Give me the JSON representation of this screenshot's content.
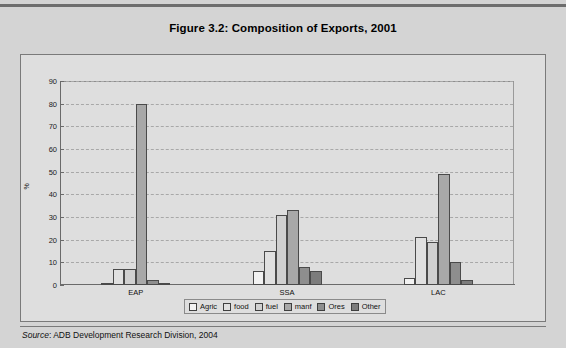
{
  "figure": {
    "title": "Figure 3.2:  Composition of Exports, 2001",
    "source_prefix": "Source",
    "source_text": ": ADB Development Research Division, 2004"
  },
  "chart_data": {
    "type": "bar",
    "title": "Figure 3.2:  Composition of Exports, 2001",
    "xlabel": "",
    "ylabel": "%",
    "ylim": [
      0,
      90
    ],
    "ytick_step": 10,
    "yticks": [
      0,
      10,
      20,
      30,
      40,
      50,
      60,
      70,
      80,
      90
    ],
    "grid": true,
    "legend_position": "bottom",
    "categories": [
      "EAP",
      "SSA",
      "LAC"
    ],
    "series": [
      {
        "name": "Agric",
        "color": "#f2f2f2",
        "values": [
          1,
          6,
          3
        ]
      },
      {
        "name": "food",
        "color": "#e0e0e0",
        "values": [
          7,
          15,
          21
        ]
      },
      {
        "name": "fuel",
        "color": "#d0d0d0",
        "values": [
          7,
          31,
          19
        ]
      },
      {
        "name": "manf",
        "color": "#a8a8a8",
        "values": [
          80,
          33,
          49
        ]
      },
      {
        "name": "Ores",
        "color": "#8e8e8e",
        "values": [
          2,
          8,
          10
        ]
      },
      {
        "name": "Other",
        "color": "#7c7c7c",
        "values": [
          1,
          6,
          2
        ]
      }
    ]
  }
}
